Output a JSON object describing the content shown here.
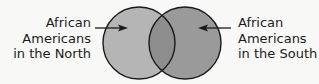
{
  "diagram": {
    "type": "venn",
    "sets": [
      {
        "id": "north",
        "label_lines": [
          "African",
          "Americans",
          "in the North"
        ],
        "fill": "#b5b5b5"
      },
      {
        "id": "south",
        "label_lines": [
          "African",
          "Americans",
          "in the South"
        ],
        "fill": "#999999"
      }
    ],
    "overlap_fill": "#8f8f8f",
    "stroke": "#1a1a1a"
  }
}
